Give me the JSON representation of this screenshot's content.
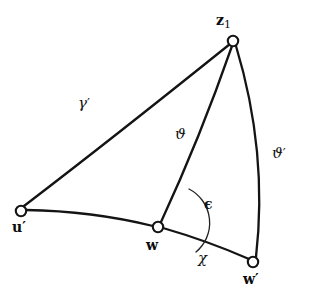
{
  "figure": {
    "kind": "spherical-triangle-diagram",
    "background_color": "#ffffff",
    "stroke_color": "#141414",
    "width": 312,
    "height": 303
  },
  "vertices": [
    {
      "id": "z1",
      "label_main": "z",
      "label_sub": "1",
      "label_prime": "",
      "x": 233,
      "y": 41,
      "label_x": 216,
      "label_y": 13
    },
    {
      "id": "u-prime",
      "label_main": "u",
      "label_sub": "",
      "label_prime": "′",
      "x": 21,
      "y": 211,
      "label_x": 12,
      "label_y": 220
    },
    {
      "id": "w",
      "label_main": "w",
      "label_sub": "",
      "label_prime": "",
      "x": 158,
      "y": 227,
      "label_x": 146,
      "label_y": 238
    },
    {
      "id": "w-prime",
      "label_main": "w",
      "label_sub": "",
      "label_prime": "′",
      "x": 253,
      "y": 262,
      "label_x": 243,
      "label_y": 272
    }
  ],
  "arcs": [
    {
      "id": "gamma-prime-arc",
      "from": "u-prime",
      "to": "z1",
      "d": "M 24 206 Q 113 138 230 44"
    },
    {
      "id": "theta-arc",
      "from": "w",
      "to": "z1",
      "d": "M 161 222 Q 200 138 232 46"
    },
    {
      "id": "theta-prime-arc",
      "from": "z1",
      "to": "w-prime",
      "d": "M 236 46 Q 268 152 256 257"
    },
    {
      "id": "base-arc-u-to-w",
      "from": "u-prime",
      "to": "w",
      "d": "M 26 210 Q 92 211 153 226"
    },
    {
      "id": "chi-arc-w-to-wprime",
      "from": "w",
      "to": "w-prime",
      "d": "M 163 228 Q 208 241 249 259"
    }
  ],
  "angle_marks": [
    {
      "id": "epsilon-angle",
      "vertex": "w",
      "d": "M 189 189 A 38 38 0 0 1 196 252"
    }
  ],
  "edge_labels": [
    {
      "id": "gamma-prime",
      "text": "γ",
      "prime": "′",
      "x": 78,
      "y": 96,
      "bold": false
    },
    {
      "id": "theta",
      "text": "ϑ",
      "prime": "",
      "x": 175,
      "y": 127,
      "bold": false
    },
    {
      "id": "theta-prime",
      "text": "ϑ",
      "prime": "′",
      "x": 272,
      "y": 146,
      "bold": false
    },
    {
      "id": "epsilon",
      "text": "ϵ",
      "prime": "",
      "x": 204,
      "y": 197,
      "bold": true
    },
    {
      "id": "chi",
      "text": "χ",
      "prime": "",
      "x": 198,
      "y": 251,
      "bold": false
    }
  ]
}
